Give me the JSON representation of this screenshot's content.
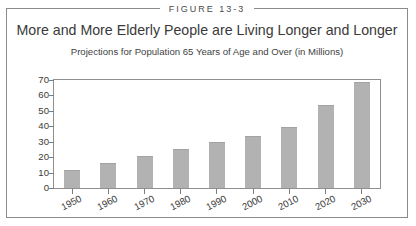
{
  "figure": {
    "tag": "FIGURE 13-3"
  },
  "chart_data": {
    "type": "bar",
    "title": "More and More Elderly People are Living Longer and Longer",
    "subtitle": "Projections for Population 65 Years of Age and Over (in Millions)",
    "xlabel": "",
    "ylabel": "",
    "ylim": [
      0,
      70
    ],
    "yticks": [
      0,
      10,
      20,
      30,
      40,
      50,
      60,
      70
    ],
    "ytick_labels": [
      "0",
      "10",
      "20",
      "30",
      "40",
      "50",
      "60",
      "70"
    ],
    "grid": false,
    "legend": false,
    "bar_color": "#b2b2b2",
    "categories": [
      "1950",
      "1960",
      "1970",
      "1980",
      "1990",
      "2000",
      "2010",
      "2020",
      "2030"
    ],
    "values": [
      12,
      16.5,
      20.5,
      25,
      30,
      34,
      39.5,
      53.5,
      69
    ]
  }
}
